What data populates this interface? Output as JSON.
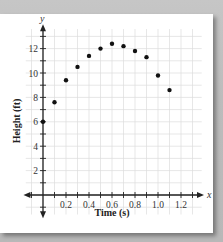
{
  "chart_data": {
    "type": "scatter",
    "title": "",
    "xlabel": "Time (s)",
    "ylabel": "Height (ft)",
    "x_axis_var": "x",
    "y_axis_var": "y",
    "xlim": [
      -0.2,
      1.4
    ],
    "ylim": [
      -2,
      14
    ],
    "x_ticks": [
      0.2,
      0.4,
      0.6,
      0.8,
      1.0,
      1.2
    ],
    "x_tick_labels": [
      "0.2",
      "0.4",
      "0.6",
      "0.8",
      "1.0",
      "1.2"
    ],
    "y_ticks": [
      2,
      4,
      6,
      8,
      10,
      12
    ],
    "y_tick_labels": [
      "2",
      "4",
      "6",
      "8",
      "10",
      "12"
    ],
    "grid": true,
    "legend": null,
    "series": [
      {
        "name": "Height vs Time",
        "x": [
          0,
          0.1,
          0.2,
          0.3,
          0.4,
          0.5,
          0.6,
          0.7,
          0.8,
          0.9,
          1.0,
          1.1
        ],
        "y": [
          6.0,
          7.6,
          9.4,
          10.5,
          11.4,
          12.0,
          12.4,
          12.2,
          11.8,
          11.3,
          9.8,
          8.6
        ]
      }
    ]
  },
  "labels": {
    "xlabel": "Time (s)",
    "ylabel": "Height (ft)",
    "x_var": "x",
    "y_var": "y"
  },
  "colors": {
    "point": "#111111",
    "axis": "#222222",
    "grid": "#dcdcdc",
    "background": "#ffffff"
  }
}
